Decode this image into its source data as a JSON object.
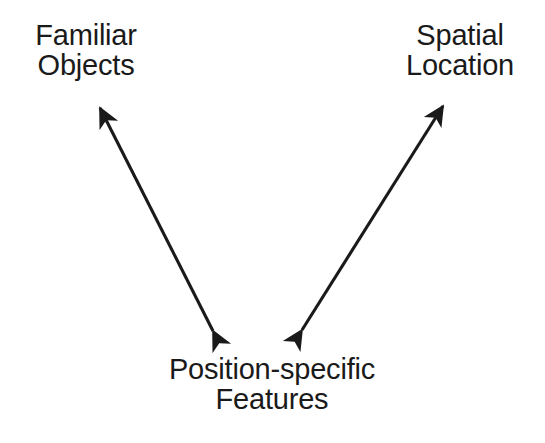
{
  "figure": {
    "type": "concept-diagram",
    "width": 545,
    "height": 443,
    "background_color": "#ffffff",
    "line_color": "#1a1a1a",
    "text_color": "#1a1a1a"
  },
  "nodes": [
    {
      "id": "familiar-objects",
      "label": "Familiar Objects",
      "lines": [
        "Familiar",
        "Objects"
      ],
      "position": "top-left"
    },
    {
      "id": "spatial-location",
      "label": "Spatial Location",
      "lines": [
        "Spatial",
        "Location"
      ],
      "position": "top-right"
    },
    {
      "id": "position-specific-features",
      "label": "Position-specific Features",
      "lines": [
        "Position-specific",
        "Features"
      ],
      "position": "bottom-center"
    }
  ],
  "edges": [
    {
      "id": "edge-familiar-objects-position-specific-features",
      "from": "position-specific-features",
      "to": "familiar-objects",
      "direction": "bidirectional",
      "arrowheads": "both",
      "x1": 213,
      "y1": 331,
      "x2": 100,
      "y2": 108
    },
    {
      "id": "edge-spatial-location-position-specific-features",
      "from": "position-specific-features",
      "to": "spatial-location",
      "direction": "bidirectional",
      "arrowheads": "both",
      "x1": 302,
      "y1": 330,
      "x2": 443,
      "y2": 106
    }
  ]
}
